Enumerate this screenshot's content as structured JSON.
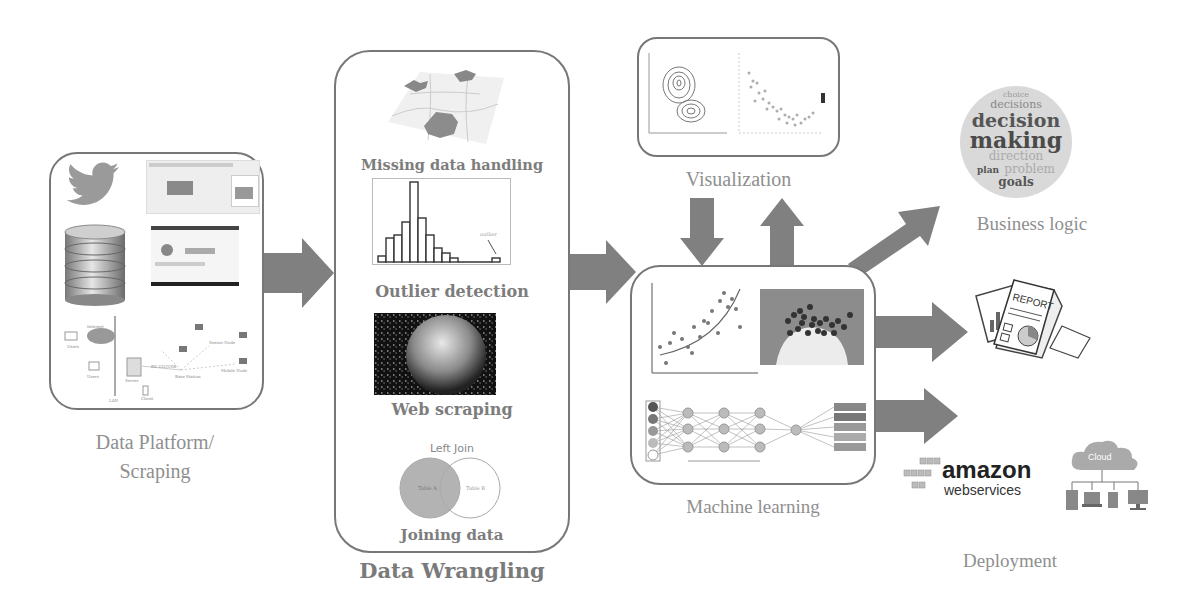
{
  "stages": {
    "data_platform": {
      "label_line1": "Data Platform/",
      "label_line2": "Scraping",
      "network_labels": [
        "Users",
        "Internet",
        "Users",
        "LAN",
        "Server",
        "RS-232/USB",
        "Client",
        "Base Station",
        "Sensor Node",
        "Mobile Node"
      ]
    },
    "data_wrangling": {
      "title": "Data Wrangling",
      "steps": [
        {
          "label": "Missing data handling"
        },
        {
          "label": "Outlier detection",
          "annotation": "outlier"
        },
        {
          "label": "Web scraping"
        },
        {
          "label": "Joining data",
          "venn_title": "Left Join",
          "table_a": "Table A",
          "table_b": "Table B"
        }
      ]
    },
    "visualization": {
      "label": "Visualization"
    },
    "machine_learning": {
      "label": "Machine learning"
    },
    "business_logic": {
      "label": "Business logic",
      "wordcloud": [
        "choice",
        "decisions",
        "decision",
        "making",
        "direction",
        "problem",
        "plan",
        "process",
        "goals",
        "strategy",
        "what"
      ]
    },
    "report": {
      "title": "REPORT"
    },
    "deployment": {
      "label": "Deployment",
      "aws_line1": "amazon",
      "aws_line2": "webservices",
      "cloud_label": "Cloud"
    }
  },
  "colors": {
    "arrow": "#808080",
    "border": "#777777",
    "text": "#8f8f8f"
  }
}
